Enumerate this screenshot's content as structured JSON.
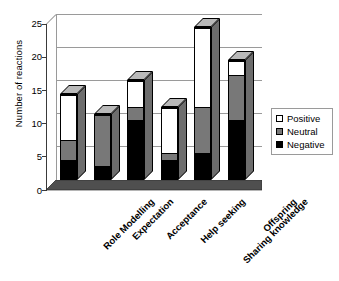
{
  "chart_data": {
    "type": "bar",
    "subtype": "stacked-bar-3d",
    "title": "",
    "xlabel": "",
    "ylabel": "Number of reactions",
    "ylim": [
      0,
      25
    ],
    "yticks": [
      0,
      5,
      10,
      15,
      20,
      25
    ],
    "grid": true,
    "legend_position": "right",
    "stack_order_bottom_to_top": [
      "Negative",
      "Neutral",
      "Positive"
    ],
    "categories": [
      "Role Modelling",
      "Expectation",
      "Acceptance",
      "Help seeking",
      "Sharing knowledge",
      "Offspring"
    ],
    "series": [
      {
        "name": "Negative",
        "color": "#000000",
        "values": [
          3,
          2,
          9,
          3,
          4,
          9
        ]
      },
      {
        "name": "Neutral",
        "color": "#787878",
        "values": [
          3,
          8,
          2,
          1,
          7,
          7
        ]
      },
      {
        "name": "Positive",
        "color": "#ffffff",
        "values": [
          7,
          0,
          4,
          7,
          12,
          2
        ]
      }
    ],
    "totals": [
      13,
      10,
      15,
      11,
      23,
      18
    ]
  },
  "axis": {
    "y_title": "Number of reactions",
    "y_tick_labels": [
      "25",
      "20",
      "15",
      "10",
      "5",
      "0"
    ]
  },
  "legend": {
    "items": [
      {
        "label": "Positive",
        "color": "#ffffff"
      },
      {
        "label": "Neutral",
        "color": "#787878"
      },
      {
        "label": "Negative",
        "color": "#000000"
      }
    ]
  }
}
